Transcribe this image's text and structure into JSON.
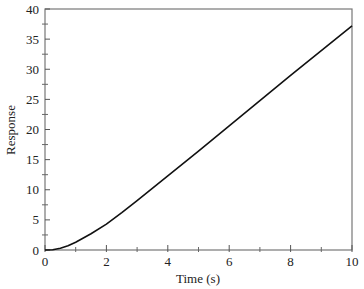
{
  "chart_data": {
    "type": "line",
    "title": "",
    "xlabel": "Time (s)",
    "ylabel": "Response",
    "xlim": [
      0,
      10
    ],
    "ylim": [
      0,
      40
    ],
    "x_ticks": [
      0,
      2,
      4,
      6,
      8,
      10
    ],
    "x_minor_ticks": [
      1,
      3,
      5,
      7,
      9
    ],
    "y_ticks": [
      0,
      5,
      10,
      15,
      20,
      25,
      30,
      35,
      40
    ],
    "y_minor_ticks": [
      2.5,
      7.5,
      12.5,
      17.5,
      22.5,
      27.5,
      32.5,
      37.5
    ],
    "grid": false,
    "legend": null,
    "series": [
      {
        "name": "Response",
        "color": "#111111",
        "x": [
          0,
          0.25,
          0.5,
          0.75,
          1,
          1.5,
          2,
          2.5,
          3,
          4,
          5,
          6,
          7,
          8,
          9,
          10
        ],
        "values": [
          0,
          0.05,
          0.3,
          0.7,
          1.3,
          2.7,
          4.3,
          6.2,
          8.2,
          12.3,
          16.4,
          20.6,
          24.8,
          29.0,
          33.1,
          37.2
        ]
      }
    ]
  }
}
